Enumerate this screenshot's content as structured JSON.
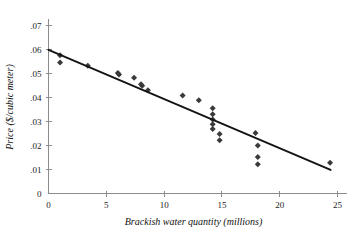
{
  "chart_data": {
    "type": "scatter",
    "title": "",
    "xlabel": "Brackish water quantity (millions)",
    "ylabel": "Price ($/cubic meter)",
    "xlim": [
      0,
      25.6
    ],
    "ylim": [
      0,
      0.072
    ],
    "xticks": [
      0,
      5,
      10,
      15,
      20,
      25
    ],
    "xticklabels": [
      "0",
      "5",
      "10",
      "15",
      "20",
      "25"
    ],
    "yticks": [
      0,
      0.01,
      0.02,
      0.03,
      0.04,
      0.05,
      0.06,
      0.07
    ],
    "yticklabels": [
      "0",
      ".01",
      ".02",
      ".03",
      ".04",
      ".05",
      ".06",
      ".07"
    ],
    "grid": false,
    "legend": null,
    "marker": "diamond",
    "marker_color": "#3a3a3a",
    "line_color": "#141414",
    "points": [
      {
        "x": 1.0,
        "y": 0.0575
      },
      {
        "x": 1.0,
        "y": 0.0545
      },
      {
        "x": 3.4,
        "y": 0.0532
      },
      {
        "x": 6.0,
        "y": 0.0502
      },
      {
        "x": 6.1,
        "y": 0.0495
      },
      {
        "x": 7.4,
        "y": 0.0482
      },
      {
        "x": 8.0,
        "y": 0.0455
      },
      {
        "x": 8.1,
        "y": 0.0448
      },
      {
        "x": 8.6,
        "y": 0.043
      },
      {
        "x": 11.6,
        "y": 0.0408
      },
      {
        "x": 13.0,
        "y": 0.0388
      },
      {
        "x": 14.2,
        "y": 0.0355
      },
      {
        "x": 14.2,
        "y": 0.033
      },
      {
        "x": 14.2,
        "y": 0.0308
      },
      {
        "x": 14.2,
        "y": 0.0288
      },
      {
        "x": 14.2,
        "y": 0.0268
      },
      {
        "x": 14.8,
        "y": 0.0248
      },
      {
        "x": 14.8,
        "y": 0.0222
      },
      {
        "x": 17.9,
        "y": 0.0252
      },
      {
        "x": 18.1,
        "y": 0.02
      },
      {
        "x": 18.1,
        "y": 0.0152
      },
      {
        "x": 18.1,
        "y": 0.0122
      },
      {
        "x": 24.35,
        "y": 0.0128
      }
    ],
    "trend_line": {
      "x0": 0.0,
      "y0": 0.0598,
      "x1": 24.4,
      "y1": 0.0098
    }
  }
}
